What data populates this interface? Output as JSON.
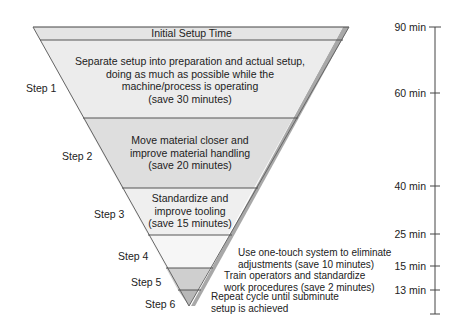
{
  "funnel": {
    "header": "Initial Setup Time",
    "colors": {
      "band_light": "#ececec",
      "band_mid": "#dcdcdc",
      "band_lighter": "#f4f4f4",
      "edge_shadow": "#9a9a9a",
      "divider": "#555555"
    },
    "steps": [
      {
        "label": "Step 1",
        "text_lines": [
          "Separate setup into preparation and actual setup,",
          "doing as much as possible while the",
          "machine/process is operating",
          "(save 30 minutes)"
        ],
        "saving_min": 30
      },
      {
        "label": "Step 2",
        "text_lines": [
          "Move material closer and",
          "improve material handling",
          "(save 20 minutes)"
        ],
        "saving_min": 20
      },
      {
        "label": "Step 3",
        "text_lines": [
          "Standardize and",
          "improve tooling",
          "(save 15 minutes)"
        ],
        "saving_min": 15
      },
      {
        "label": "Step 4",
        "text_lines": [
          "Use one-touch system to eliminate",
          "adjustments (save 10 minutes)"
        ],
        "saving_min": 10
      },
      {
        "label": "Step 5",
        "text_lines": [
          "Train operators and standardize",
          "work procedures (save 2 minutes)"
        ],
        "saving_min": 2
      },
      {
        "label": "Step 6",
        "text_lines": [
          "Repeat cycle until subminute",
          "setup is achieved"
        ],
        "saving_min": null
      }
    ]
  },
  "timeline": {
    "ticks": [
      {
        "label": "90 min",
        "value": 90
      },
      {
        "label": "60 min",
        "value": 60
      },
      {
        "label": "40 min",
        "value": 40
      },
      {
        "label": "25 min",
        "value": 25
      },
      {
        "label": "15 min",
        "value": 15
      },
      {
        "label": "13 min",
        "value": 13
      }
    ]
  }
}
